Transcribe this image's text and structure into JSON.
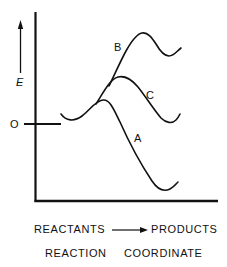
{
  "diagram": {
    "type": "reaction energy profile",
    "y_axis": {
      "label": "E",
      "zero_label": "O"
    },
    "curves": [
      {
        "id": "A",
        "label": "A",
        "description": "low barrier, products lower in energy than reactants"
      },
      {
        "id": "B",
        "label": "B",
        "description": "high barrier, products higher in energy than reactants"
      },
      {
        "id": "C",
        "label": "C",
        "description": "intermediate barrier, products at same energy as reactants"
      }
    ],
    "x_axis": {
      "reactants": "REACTANTS",
      "products": "PRODUCTS",
      "title": "REACTION",
      "title2": "COORDINATE"
    },
    "colors": {
      "line": "#111111",
      "background": "#ffffff"
    }
  }
}
